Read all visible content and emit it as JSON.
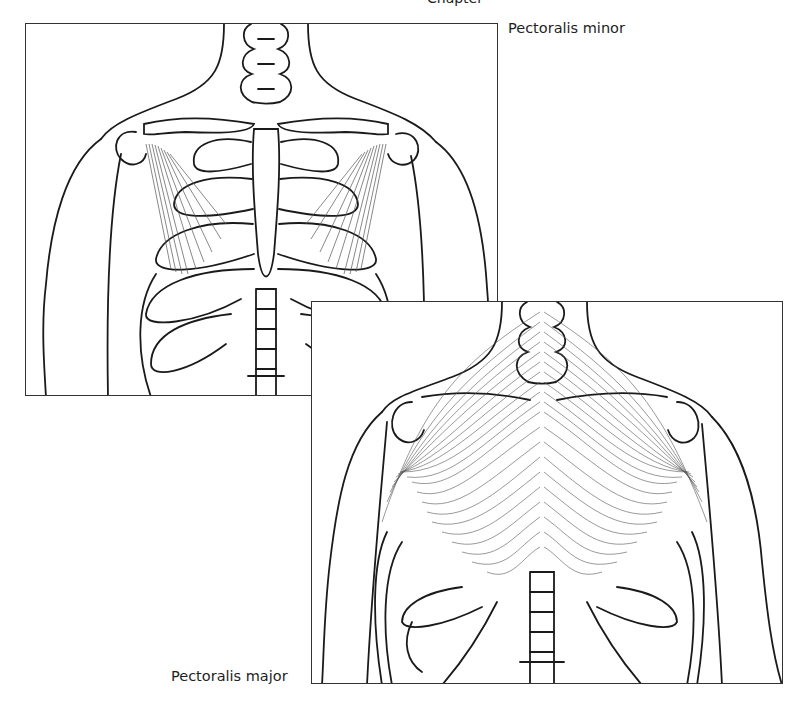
{
  "figure": {
    "caption_fragment": "Chapter",
    "panels": [
      {
        "id": "pectoralis-minor",
        "label": "Pectoralis minor",
        "view": "anterior thorax, skeleton with pectoralis minor muscles highlighted"
      },
      {
        "id": "pectoralis-major",
        "label": "Pectoralis major",
        "view": "anterior thorax, skeleton with pectoralis major muscle fan highlighted"
      }
    ]
  },
  "colors": {
    "line": "#1a1a1a",
    "muscle_fiber": "#555555",
    "frame": "#333333",
    "background": "#ffffff"
  }
}
